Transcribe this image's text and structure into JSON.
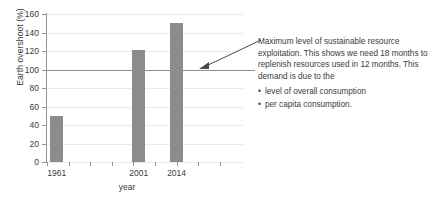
{
  "chart_data": {
    "type": "bar",
    "title": "",
    "xlabel": "year",
    "ylabel": "Earth overshoot (%)",
    "categories": [
      "1961",
      "2001",
      "2014"
    ],
    "values": [
      50,
      121,
      150
    ],
    "ylim": [
      0,
      160
    ],
    "yticks": [
      0,
      20,
      40,
      60,
      80,
      100,
      120,
      140,
      160
    ],
    "ytick_labels": [
      "0",
      "20",
      "40",
      "60",
      "80",
      "100",
      "120",
      "140",
      "160"
    ],
    "grid": true,
    "legend": "none",
    "bar_color": "#8c8c8c",
    "annotations": [
      {
        "name": "threshold-line",
        "value": 100,
        "label": "Maximum level of sustainable resource exploitation."
      }
    ]
  },
  "annotation": {
    "paragraph": "Maximum level of sustainable resource exploitation. This shows we need 18 months to replenish resources used in 12 months. This demand is due to the",
    "bullets": [
      "level of overall consumption",
      "per capita consumption."
    ]
  },
  "axis": {
    "x_label": "year",
    "y_label": "Earth overshoot (%)"
  }
}
